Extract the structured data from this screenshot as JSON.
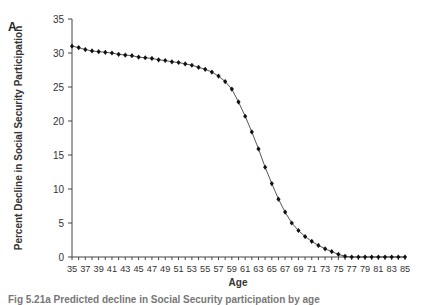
{
  "panel_label": "A",
  "caption": "Fig 5.21a  Predicted decline in Social Security participation by age",
  "chart_data": {
    "type": "line",
    "title": "",
    "xlabel": "Age",
    "ylabel": "Percent Decline in Social Security Participation",
    "xlim": [
      35,
      85
    ],
    "ylim": [
      0,
      35
    ],
    "yticks": [
      0,
      5,
      10,
      15,
      20,
      25,
      30,
      35
    ],
    "xtick_labels": [
      35,
      37,
      39,
      41,
      43,
      45,
      47,
      49,
      51,
      53,
      55,
      57,
      59,
      61,
      63,
      65,
      67,
      69,
      71,
      73,
      75,
      77,
      79,
      81,
      83,
      85
    ],
    "grid": false,
    "legend": null,
    "marker": "diamond",
    "series": [
      {
        "name": "Percent Decline",
        "x": [
          35,
          36,
          37,
          38,
          39,
          40,
          41,
          42,
          43,
          44,
          45,
          46,
          47,
          48,
          49,
          50,
          51,
          52,
          53,
          54,
          55,
          56,
          57,
          58,
          59,
          60,
          61,
          62,
          63,
          64,
          65,
          66,
          67,
          68,
          69,
          70,
          71,
          72,
          73,
          74,
          75,
          76,
          77,
          78,
          79,
          80,
          81,
          82,
          83,
          84,
          85
        ],
        "values": [
          31.0,
          30.8,
          30.5,
          30.3,
          30.2,
          30.1,
          30.0,
          29.8,
          29.7,
          29.6,
          29.4,
          29.3,
          29.2,
          29.0,
          28.9,
          28.7,
          28.6,
          28.4,
          28.2,
          27.9,
          27.6,
          27.2,
          26.6,
          25.8,
          24.7,
          22.8,
          20.7,
          18.4,
          15.9,
          13.2,
          10.8,
          8.5,
          6.6,
          5.0,
          3.9,
          3.0,
          2.3,
          1.7,
          1.2,
          0.8,
          0.4,
          0.1,
          0.0,
          0.0,
          0.0,
          0.0,
          0.0,
          0.0,
          0.0,
          0.0,
          0.0
        ]
      }
    ]
  },
  "colors": {
    "line": "#555555",
    "marker": "#111111",
    "axis": "#444444"
  }
}
